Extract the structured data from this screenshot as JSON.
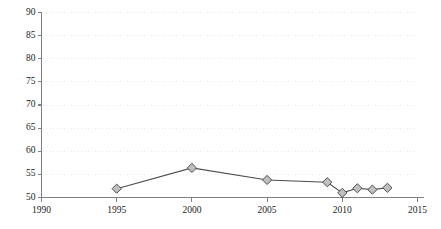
{
  "chart_data": {
    "type": "line",
    "title": "",
    "subtitle": "",
    "xlabel": "",
    "ylabel": "",
    "xlim": [
      1990,
      2015
    ],
    "ylim": [
      50,
      90
    ],
    "grid": true,
    "grid_orientation": "horizontal",
    "grid_style": "dotted",
    "legend": false,
    "legend_position": "none",
    "x_ticks": [
      1990,
      1995,
      2000,
      2005,
      2010,
      2015
    ],
    "x_tick_labels": [
      "1990",
      "1995",
      "2000",
      "2005",
      "2010",
      "2015"
    ],
    "y_ticks": [
      50,
      55,
      60,
      65,
      70,
      75,
      80,
      85,
      90
    ],
    "y_tick_labels": [
      "50",
      "55",
      "60",
      "65",
      "70",
      "75",
      "80",
      "85",
      "90"
    ],
    "marker": "diamond",
    "series": [
      {
        "name": "series-1",
        "x": [
          1995,
          2000,
          2005,
          2009,
          2010,
          2011,
          2012,
          2013
        ],
        "values": [
          51.9,
          56.4,
          53.8,
          53.3,
          51.0,
          52.0,
          51.7,
          52.1
        ]
      }
    ]
  },
  "style": {
    "line_color": "#4d4d4d",
    "marker_fill": "#bfbfbf",
    "marker_stroke": "#4d4d4d",
    "grid_color": "#e8e8f0",
    "axis_color": "#808080",
    "tick_text_color": "#222222",
    "background": "#ffffff"
  }
}
